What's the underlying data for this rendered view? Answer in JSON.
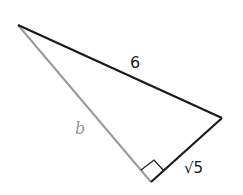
{
  "diagram": {
    "type": "right-triangle",
    "vertices": {
      "top_left": [
        18,
        25
      ],
      "right": [
        222,
        118
      ],
      "right_angle": [
        151,
        182
      ]
    },
    "sides": {
      "hypotenuse": {
        "label": "6",
        "color": "#1a1a1a"
      },
      "leg_b": {
        "label": "b",
        "color": "#999999"
      },
      "leg_short": {
        "label": "√5",
        "color": "#1a1a1a"
      }
    },
    "right_angle_marker": true
  }
}
